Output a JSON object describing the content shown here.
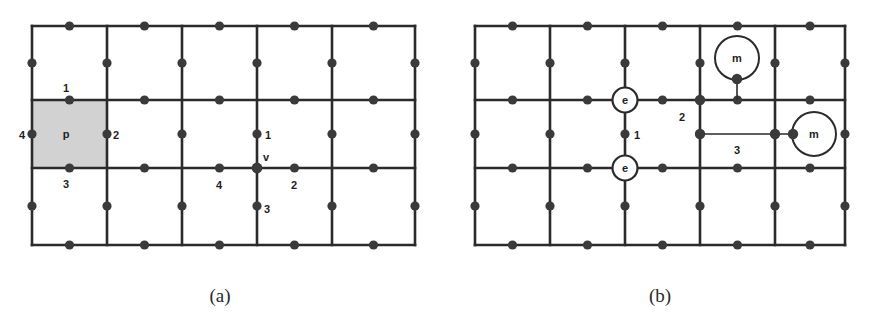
{
  "figure": {
    "background_color": "#ffffff",
    "line_color": "#2b2b2b",
    "dot_color": "#3a3a3a",
    "shade_color": "#d2d2d2",
    "panels": [
      {
        "id": "a",
        "caption": "(a)",
        "grid": {
          "columns": 5,
          "rows": 3,
          "x_lines": [
            32,
            107,
            182,
            257,
            332,
            415
          ],
          "y_lines": [
            26,
            100,
            168,
            245
          ]
        },
        "shaded_plaquette": {
          "label": "p",
          "x0": 32,
          "y0": 100,
          "x1": 107,
          "y1": 168
        },
        "plaquette_edge_labels": [
          {
            "text": "1",
            "position": "top"
          },
          {
            "text": "2",
            "position": "right"
          },
          {
            "text": "3",
            "position": "bottom"
          },
          {
            "text": "4",
            "position": "left"
          }
        ],
        "vertex": {
          "label": "v",
          "x": 257,
          "y": 168
        },
        "vertex_edge_labels": [
          {
            "text": "1",
            "position": "up"
          },
          {
            "text": "2",
            "position": "right"
          },
          {
            "text": "3",
            "position": "down"
          },
          {
            "text": "4",
            "position": "left"
          }
        ]
      },
      {
        "id": "b",
        "caption": "(b)",
        "grid": {
          "columns": 5,
          "rows": 3,
          "x_lines": [
            475,
            550,
            625,
            700,
            775,
            845
          ],
          "y_lines": [
            26,
            100,
            168,
            245
          ]
        },
        "excitations": [
          {
            "symbol": "e",
            "x": 625,
            "y": 100,
            "kind": "vertex-charge"
          },
          {
            "symbol": "e",
            "x": 625,
            "y": 168,
            "kind": "vertex-charge"
          },
          {
            "symbol": "m",
            "x": 737,
            "y": 62,
            "kind": "plaquette-flux"
          },
          {
            "symbol": "m",
            "x": 812,
            "y": 134,
            "kind": "plaquette-flux"
          }
        ],
        "string_labels": [
          {
            "text": "1",
            "x": 634,
            "y": 136
          },
          {
            "text": "2",
            "x": 690,
            "y": 118
          },
          {
            "text": "3",
            "x": 737,
            "y": 152
          }
        ]
      }
    ]
  }
}
